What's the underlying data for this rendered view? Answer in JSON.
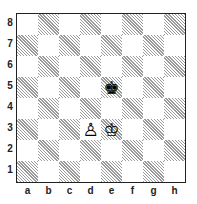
{
  "diagram": {
    "type": "chess-position",
    "orientation": "white-bottom",
    "files": [
      "a",
      "b",
      "c",
      "d",
      "e",
      "f",
      "g",
      "h"
    ],
    "ranks": [
      "8",
      "7",
      "6",
      "5",
      "4",
      "3",
      "2",
      "1"
    ],
    "pieces": [
      {
        "square": "e5",
        "color": "black",
        "type": "king",
        "glyph": "♚"
      },
      {
        "square": "d3",
        "color": "white",
        "type": "pawn",
        "glyph": "♙"
      },
      {
        "square": "e3",
        "color": "white",
        "type": "king",
        "glyph": "♔"
      }
    ],
    "colors": {
      "light_square": "#ffffff",
      "dark_square_hatch": "#9a9a9a",
      "border": "#222222"
    }
  }
}
